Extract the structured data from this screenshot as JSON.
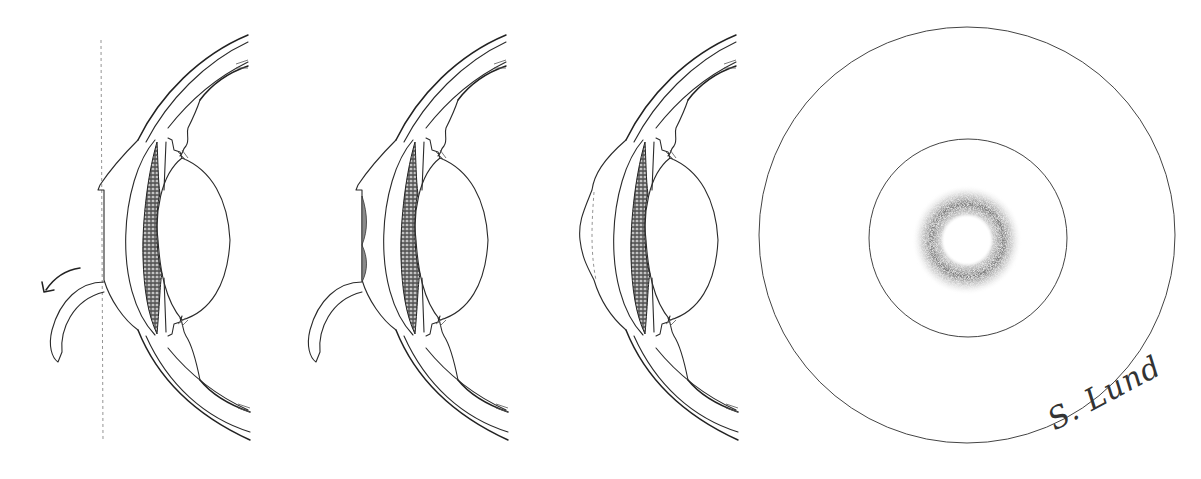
{
  "figure": {
    "type": "medical-illustration",
    "panels": [
      {
        "id": "panel-1",
        "description": "Eye cross-section with corneal flap lifted, reference vertical dashed line, curved arrow indicating flap folding back",
        "has_arrow": true,
        "has_dashed_reference": true
      },
      {
        "id": "panel-2",
        "description": "Eye cross-section with flap lifted and shaded stromal ablation region at central cornea",
        "has_shaded_ablation": true
      },
      {
        "id": "panel-3",
        "description": "Eye cross-section with flap repositioned, dashed interface line, slightly bulging anterior cornea",
        "has_dashed_interface": true
      },
      {
        "id": "panel-4",
        "description": "Frontal view: two concentric circles with a stippled annular haze ring at center"
      }
    ],
    "circles": {
      "outer": {
        "cx": 967,
        "cy": 235,
        "r": 208
      },
      "inner": {
        "cx": 968,
        "cy": 238,
        "r": 99
      },
      "haze_ring": {
        "cx": 967,
        "cy": 240,
        "inner_r": 23,
        "peak_r": 35,
        "outer_r": 52
      }
    },
    "colors": {
      "line": "#2a2a2a",
      "background": "#ffffff",
      "stipple": "#555555"
    },
    "signature": "S. Lund"
  }
}
